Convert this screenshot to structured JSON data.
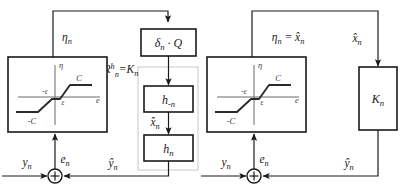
{
  "figure": {
    "colors": {
      "line": "#1a1a1a",
      "faint_line": "#c8c8c8",
      "axis": "#6b6b6b",
      "curve": "#2a2a2a",
      "background": "#ffffff"
    }
  },
  "left_diagram": {
    "name": "left-block-diagram",
    "blocks": [
      {
        "id": "delta-q",
        "label_main": "δ",
        "label_sub": "n",
        "label_tail": " · Q"
      },
      {
        "id": "h-minus-n",
        "label_main": "h",
        "label_sub": "-n",
        "label_tail": ""
      },
      {
        "id": "h-n",
        "label_main": "h",
        "label_sub": "n",
        "label_tail": ""
      }
    ],
    "signals": {
      "eta_n": {
        "main": "η",
        "sub": "n"
      },
      "R_eq_K": {
        "main": "R",
        "sup": "h",
        "sub": "n",
        "tail": "=K",
        "tail_sub": "n"
      },
      "x_hat_n": {
        "main": "x̂",
        "sub": "n"
      },
      "y_n": {
        "main": "y",
        "sub": "n"
      },
      "e_n": {
        "main": "e",
        "sub": "n"
      },
      "y_hat_n": {
        "main": "ŷ",
        "sub": "n"
      }
    },
    "nonlinearity": {
      "name": "dead-zone-saturation-plot",
      "y_axis_label": "η",
      "x_axis_label": "e",
      "upper_sat_label": "C",
      "lower_sat_label": "-C",
      "pos_knee_label": "ε",
      "neg_knee_label": "-ε"
    },
    "sum_junction": {
      "name": "summing-junction",
      "symbol": "+"
    }
  },
  "right_diagram": {
    "name": "right-block-diagram",
    "blocks": [
      {
        "id": "k-n",
        "label_main": "K",
        "label_sub": "n",
        "label_tail": ""
      }
    ],
    "signals": {
      "eta_eq_xhat": {
        "main": "η",
        "sub": "n",
        "tail": " = x̂",
        "tail_sub": "n"
      },
      "x_hat_n": {
        "main": "x̂",
        "sub": "n"
      },
      "y_n": {
        "main": "y",
        "sub": "n"
      },
      "e_n": {
        "main": "e",
        "sub": "n"
      },
      "y_hat_n": {
        "main": "ŷ",
        "sub": "n"
      }
    },
    "nonlinearity": {
      "name": "dead-zone-saturation-plot",
      "y_axis_label": "η",
      "x_axis_label": "e",
      "upper_sat_label": "C",
      "lower_sat_label": "-C",
      "pos_knee_label": "ε",
      "neg_knee_label": "-ε"
    },
    "sum_junction": {
      "name": "summing-junction",
      "symbol": "+"
    }
  }
}
